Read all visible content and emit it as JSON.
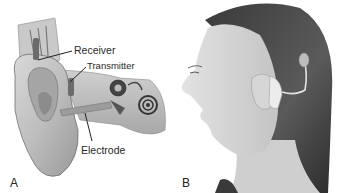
{
  "panels": [
    {
      "id": "A",
      "label": "A",
      "description": "Cutaway illustration of the ear with cochlear implant",
      "callouts": [
        {
          "text": "Receiver"
        },
        {
          "text": "Transmitter"
        },
        {
          "text": "Electrode"
        }
      ]
    },
    {
      "id": "B",
      "label": "B",
      "description": "Profile photo of woman wearing cochlear implant processor behind the ear"
    }
  ]
}
